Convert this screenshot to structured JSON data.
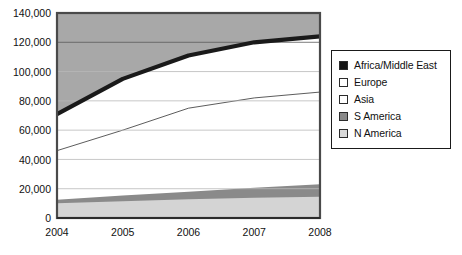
{
  "chart_data": {
    "type": "area",
    "stacked": true,
    "title": "",
    "subtitle": "",
    "xlabel": "",
    "ylabel": "",
    "categories": [
      "2004",
      "2005",
      "2006",
      "2007",
      "2008"
    ],
    "x_tick_labels": [
      "2004",
      "2005",
      "2006",
      "2007",
      "2008"
    ],
    "y_tick_labels": [
      "0",
      "20,000",
      "40,000",
      "60,000",
      "80,000",
      "100,000",
      "120,000",
      "140,000"
    ],
    "y_tick_values": [
      0,
      20000,
      40000,
      60000,
      80000,
      100000,
      120000,
      140000
    ],
    "ylim": [
      0,
      140000
    ],
    "xlim": [
      "2004",
      "2008"
    ],
    "grid": true,
    "grid_axis": "y",
    "legend_position": "right",
    "series": [
      {
        "name": "N America",
        "color": "#d4d4d4",
        "swatch": "#d9d9d9",
        "values": [
          10000,
          11500,
          12800,
          13800,
          14500
        ]
      },
      {
        "name": "S America",
        "color": "#8a8a8a",
        "swatch": "#8a8a8a",
        "values": [
          2500,
          3800,
          5200,
          6800,
          8500
        ]
      },
      {
        "name": "Asia",
        "color": "#ffffff",
        "swatch": "#ffffff",
        "values": [
          33500,
          44700,
          57000,
          61400,
          63000
        ]
      },
      {
        "name": "Europe",
        "color": "#ffffff",
        "swatch": "#ffffff",
        "values": [
          22000,
          32000,
          33000,
          35000,
          36000
        ]
      },
      {
        "name": "Africa/Middle East",
        "color": "#1a1a1a",
        "swatch": "#141414",
        "values": [
          3000,
          3000,
          3000,
          3000,
          2000
        ]
      }
    ],
    "cumulative_totals": [
      71000,
      95000,
      111000,
      120000,
      124000
    ],
    "cumulative_n_america": [
      10000,
      11500,
      12800,
      13800,
      14500
    ],
    "cumulative_s_america": [
      12500,
      15300,
      18000,
      20600,
      23000
    ],
    "cumulative_asia": [
      46000,
      60000,
      75000,
      82000,
      86000
    ],
    "cumulative_europe": [
      68000,
      92000,
      108000,
      117000,
      122000
    ],
    "plot_background": "#ffffff",
    "above_area_fill": "#a8a8a8",
    "axis_color": "#4a4a4a",
    "gridline_color": "#b9b9b9"
  },
  "legend": {
    "items": [
      {
        "label": "Africa/Middle East",
        "swatch": "#141414"
      },
      {
        "label": "Europe",
        "swatch": "#ffffff"
      },
      {
        "label": "Asia",
        "swatch": "#ffffff"
      },
      {
        "label": "S America",
        "swatch": "#8a8a8a"
      },
      {
        "label": "N America",
        "swatch": "#d9d9d9"
      }
    ]
  }
}
